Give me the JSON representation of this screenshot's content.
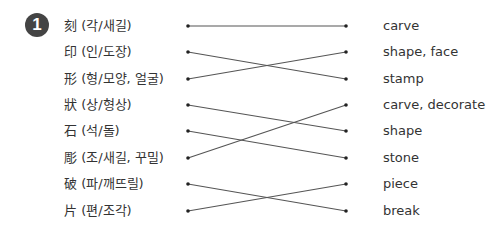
{
  "exercise": {
    "number": "1",
    "left_items": [
      {
        "label": "刻 (각/새길)",
        "y": 26
      },
      {
        "label": "印 (인/도장)",
        "y": 52
      },
      {
        "label": "形 (형/모양, 얼굴)",
        "y": 79
      },
      {
        "label": "狀 (상/형상)",
        "y": 105
      },
      {
        "label": "石 (석/돌)",
        "y": 131
      },
      {
        "label": "彫 (조/새길, 꾸밀)",
        "y": 158
      },
      {
        "label": "破 (파/깨뜨릴)",
        "y": 184
      },
      {
        "label": "片 (편/조각)",
        "y": 211
      }
    ],
    "right_items": [
      {
        "label": "carve",
        "y": 26
      },
      {
        "label": "shape, face",
        "y": 52
      },
      {
        "label": "stamp",
        "y": 79
      },
      {
        "label": "carve, decorate",
        "y": 105
      },
      {
        "label": "shape",
        "y": 131
      },
      {
        "label": "stone",
        "y": 158
      },
      {
        "label": "piece",
        "y": 184
      },
      {
        "label": "break",
        "y": 211
      }
    ],
    "connections": [
      [
        0,
        0
      ],
      [
        1,
        2
      ],
      [
        2,
        1
      ],
      [
        3,
        4
      ],
      [
        4,
        5
      ],
      [
        5,
        3
      ],
      [
        6,
        7
      ],
      [
        7,
        6
      ]
    ],
    "line_color": "#555555",
    "badge_color": "#444444"
  }
}
